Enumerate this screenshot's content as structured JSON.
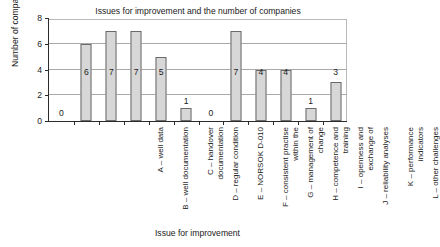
{
  "chart_data": {
    "type": "bar",
    "title": "Issues for improvement and the number of companies",
    "xlabel": "Issue for improvement",
    "ylabel": "Number of companies",
    "categories": [
      "A – well data",
      "B – well documentation",
      "C – handover documentation",
      "D – regular condition",
      "E – NORSOK D-010",
      "F – consistent practise within the",
      "G – management of change",
      "H – competence and training",
      "I – openness and exchange of",
      "J – reliability analyses",
      "K – performance indicators",
      "L – other challenges"
    ],
    "values": [
      0,
      6,
      7,
      7,
      5,
      1,
      0,
      7,
      4,
      4,
      1,
      3
    ],
    "ylim": [
      0,
      8
    ],
    "yticks": [
      0,
      2,
      4,
      6,
      8
    ],
    "ytick_labels": [
      "0",
      "2",
      "4",
      "6",
      "8"
    ],
    "gridlines": [
      2,
      4,
      6
    ],
    "grid": true,
    "legend": null,
    "bar_color": "#d7d7d7",
    "bar_border_color": "#6a6a6a",
    "axis_color": "#2b2b2b",
    "grid_color": "#a9a9a9",
    "data_labels": [
      "0",
      "6",
      "7",
      "7",
      "5",
      "1",
      "0",
      "7",
      "4",
      "4",
      "1",
      "3"
    ]
  }
}
